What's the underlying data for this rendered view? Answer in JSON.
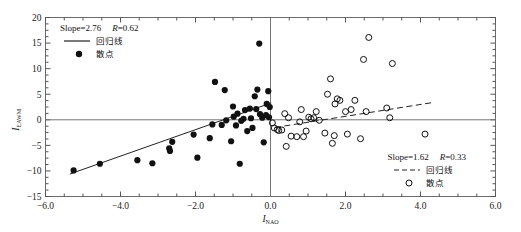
{
  "chart_data": {
    "type": "scatter",
    "title": "",
    "xlabel": "I_NAO",
    "xlabel_main": "I",
    "xlabel_sub": "NAO",
    "ylabel_main": "I",
    "ylabel_sub": "EAWM",
    "xlim": [
      -6.0,
      6.0
    ],
    "ylim": [
      -15,
      20
    ],
    "xticks": [
      -6.0,
      -4.0,
      -2.0,
      0.0,
      2.0,
      4.0,
      6.0
    ],
    "xticklabels": [
      "-6.0",
      "-4.0",
      "-2.0",
      "0.0",
      "2.0",
      "4.0",
      "6.0"
    ],
    "yticks": [
      20,
      15,
      10,
      5,
      0,
      -5,
      -10,
      -15
    ],
    "yticklabels": [
      "20",
      "15",
      "10",
      "5",
      "0",
      "-5",
      "-10",
      "-15"
    ],
    "xminor_step": 0.5,
    "yminor_step": 1.25,
    "grid": false,
    "zero_lines": {
      "x": 0,
      "y": 0
    },
    "series": [
      {
        "name": "negative-phase-group",
        "marker": "filled-circle",
        "marker_color": "#111111",
        "legend_slope_label": "Slope=2.76",
        "legend_r_label": "R=0.62",
        "legend_line_label": "回归线",
        "legend_point_label": "散点",
        "slope": 2.76,
        "r": 0.62,
        "fit_line": {
          "style": "solid",
          "x0": -5.35,
          "y0": -10.6,
          "x1": 0.02,
          "y1": 3.3
        },
        "points": [
          [
            -5.25,
            -9.9
          ],
          [
            -4.55,
            -8.6
          ],
          [
            -3.55,
            -7.9
          ],
          [
            -3.15,
            -8.5
          ],
          [
            -2.7,
            -5.6
          ],
          [
            -2.68,
            -6.1
          ],
          [
            -2.62,
            -4.3
          ],
          [
            -2.05,
            -2.9
          ],
          [
            -1.95,
            -7.4
          ],
          [
            -1.62,
            -3.6
          ],
          [
            -1.55,
            -0.9
          ],
          [
            -1.48,
            7.4
          ],
          [
            -1.3,
            -1.0
          ],
          [
            -1.22,
            5.8
          ],
          [
            -1.18,
            -0.1
          ],
          [
            -1.05,
            -4.2
          ],
          [
            -1.0,
            2.6
          ],
          [
            -0.98,
            0.6
          ],
          [
            -0.92,
            -1.1
          ],
          [
            -0.88,
            1.2
          ],
          [
            -0.82,
            -8.6
          ],
          [
            -0.78,
            -0.2
          ],
          [
            -0.72,
            0.2
          ],
          [
            -0.68,
            1.9
          ],
          [
            -0.62,
            -2.2
          ],
          [
            -0.55,
            2.2
          ],
          [
            -0.52,
            0.3
          ],
          [
            -0.48,
            -1.6
          ],
          [
            -0.42,
            4.6
          ],
          [
            -0.38,
            2.1
          ],
          [
            -0.35,
            5.9
          ],
          [
            -0.3,
            14.9
          ],
          [
            -0.28,
            1.1
          ],
          [
            -0.22,
            0.4
          ],
          [
            -0.18,
            -4.4
          ],
          [
            -0.12,
            0.9
          ],
          [
            -0.1,
            3.1
          ],
          [
            -0.06,
            5.6
          ],
          [
            -0.04,
            0.5
          ],
          [
            -0.02,
            2.5
          ]
        ]
      },
      {
        "name": "positive-phase-group",
        "marker": "open-circle",
        "marker_color": "#111111",
        "legend_slope_label": "Slope=1.62",
        "legend_r_label": "R=0.33",
        "legend_line_label": "回归线",
        "legend_point_label": "散点",
        "slope": 1.62,
        "r": 0.33,
        "fit_line": {
          "style": "dashed",
          "x0": 0.12,
          "y0": -1.5,
          "x1": 4.35,
          "y1": 3.4
        },
        "points": [
          [
            0.05,
            -0.6
          ],
          [
            0.1,
            -1.6
          ],
          [
            0.18,
            -1.9
          ],
          [
            0.22,
            -2.1
          ],
          [
            0.3,
            -2.0
          ],
          [
            0.38,
            1.2
          ],
          [
            0.42,
            -5.2
          ],
          [
            0.48,
            0.4
          ],
          [
            0.55,
            -3.2
          ],
          [
            0.7,
            -3.3
          ],
          [
            0.78,
            -0.4
          ],
          [
            0.82,
            2.0
          ],
          [
            0.88,
            -3.3
          ],
          [
            0.95,
            -2.2
          ],
          [
            1.02,
            0.5
          ],
          [
            1.08,
            0.2
          ],
          [
            1.15,
            0.4
          ],
          [
            1.22,
            1.6
          ],
          [
            1.3,
            -0.1
          ],
          [
            1.45,
            -2.6
          ],
          [
            1.52,
            5.0
          ],
          [
            1.6,
            8.0
          ],
          [
            1.65,
            -4.6
          ],
          [
            1.7,
            -3.1
          ],
          [
            1.72,
            3.1
          ],
          [
            1.78,
            4.1
          ],
          [
            1.85,
            3.8
          ],
          [
            2.0,
            1.6
          ],
          [
            2.05,
            -2.8
          ],
          [
            2.15,
            2.0
          ],
          [
            2.25,
            3.8
          ],
          [
            2.4,
            -3.7
          ],
          [
            2.48,
            11.8
          ],
          [
            2.55,
            1.6
          ],
          [
            2.62,
            16.1
          ],
          [
            3.1,
            2.3
          ],
          [
            3.18,
            0.4
          ],
          [
            3.25,
            11.0
          ],
          [
            4.12,
            -2.8
          ]
        ]
      }
    ],
    "annotations": [
      {
        "id": "legend-top-left",
        "position": "top-left"
      },
      {
        "id": "legend-bottom-right",
        "position": "bottom-right"
      }
    ]
  }
}
